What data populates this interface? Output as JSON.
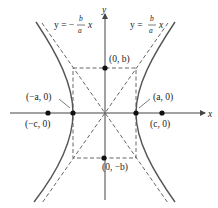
{
  "diagram": {
    "axes": {
      "x_label": "x",
      "y_label": "y"
    },
    "asymptotes": [
      {
        "eq_prefix": "y = −",
        "num": "b",
        "den": "a",
        "var": "x"
      },
      {
        "eq_prefix": "y = ",
        "num": "b",
        "den": "a",
        "var": "x"
      }
    ],
    "points": {
      "vertex_left": "(−a, 0)",
      "vertex_right": "(a, 0)",
      "focus_left": "(−c, 0)",
      "focus_right": "(c, 0)",
      "covertex_top": "(0, b)",
      "covertex_bottom": "(0, −b)"
    },
    "colors": {
      "curve": "#555555",
      "axis": "#444444",
      "dashed": "#555555",
      "point": "#111111"
    }
  }
}
